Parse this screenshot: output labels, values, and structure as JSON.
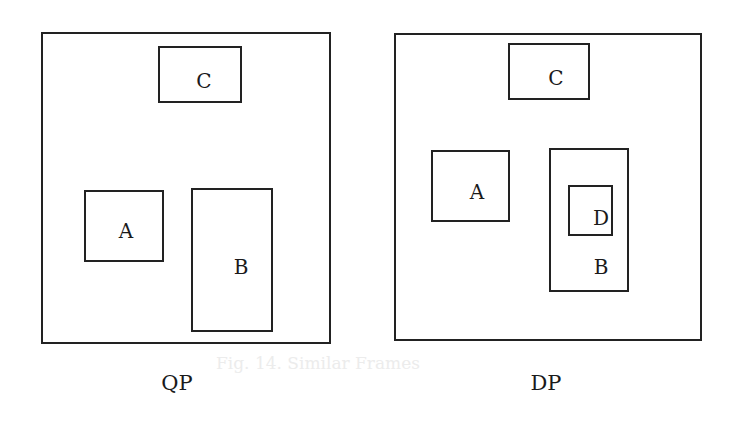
{
  "diagrams": [
    {
      "caption": "QP",
      "frame": {
        "x": 41,
        "y": 32,
        "w": 290,
        "h": 312
      },
      "regions": [
        {
          "label": "C",
          "x": 158,
          "y": 46,
          "w": 84,
          "h": 57,
          "lx": 204,
          "ly": 81
        },
        {
          "label": "A",
          "x": 84,
          "y": 190,
          "w": 80,
          "h": 72,
          "lx": 126,
          "ly": 231
        },
        {
          "label": "B",
          "x": 191,
          "y": 188,
          "w": 82,
          "h": 144,
          "lx": 241,
          "ly": 267
        }
      ]
    },
    {
      "caption": "DP",
      "frame": {
        "x": 394,
        "y": 33,
        "w": 308,
        "h": 308
      },
      "regions": [
        {
          "label": "C",
          "x": 508,
          "y": 43,
          "w": 82,
          "h": 57,
          "lx": 556,
          "ly": 78
        },
        {
          "label": "A",
          "x": 431,
          "y": 150,
          "w": 79,
          "h": 72,
          "lx": 477,
          "ly": 192
        },
        {
          "label": "B",
          "x": 549,
          "y": 148,
          "w": 80,
          "h": 144,
          "lx": 601,
          "ly": 267
        },
        {
          "label": "D",
          "x": 568,
          "y": 185,
          "w": 45,
          "h": 51,
          "lx": 601,
          "ly": 218
        }
      ]
    }
  ],
  "show_through_text": "Fig. 14. Similar Frames"
}
